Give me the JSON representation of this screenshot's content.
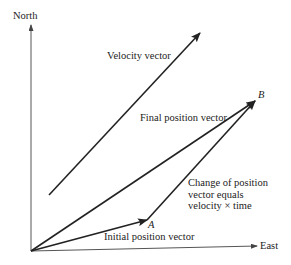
{
  "diagram": {
    "axes": {
      "y_label": "North",
      "x_label": "East"
    },
    "vectors": {
      "velocity": {
        "label": "Velocity vector",
        "from": [
          49,
          195
        ],
        "to": [
          200,
          33
        ]
      },
      "initial_position": {
        "label": "Initial position vector",
        "from": [
          31,
          251
        ],
        "to": [
          147,
          220
        ]
      },
      "final_position": {
        "label": "Final position vector",
        "from": [
          31,
          251
        ],
        "to": [
          255,
          101
        ]
      },
      "change_of_position": {
        "label_line1": "Change of position",
        "label_line2": "vector equals",
        "label_line3": "velocity × time",
        "from": [
          147,
          220
        ],
        "to": [
          255,
          101
        ]
      }
    },
    "points": {
      "a": "A",
      "b": "B"
    },
    "colors": {
      "line": "#222222",
      "axis": "#555555",
      "text": "#222222"
    }
  }
}
